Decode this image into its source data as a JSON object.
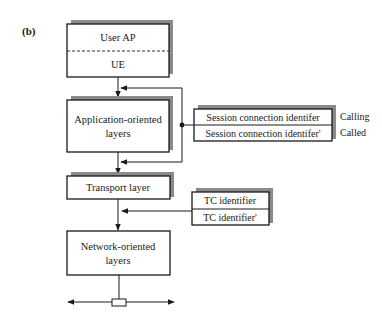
{
  "figure": {
    "label": "(b)"
  },
  "stack": {
    "user_box": {
      "top_label": "User AP",
      "bottom_label": "UE"
    },
    "application_box": {
      "line1": "Application-oriented",
      "line2": "layers"
    },
    "transport_box": {
      "label": "Transport layer"
    },
    "network_box": {
      "line1": "Network-oriented",
      "line2": "layers"
    }
  },
  "session_identifiers": {
    "rows": [
      {
        "label": "Session connection identifer",
        "side_label": "Calling"
      },
      {
        "label": "Session connection identifer'",
        "side_label": "Called"
      }
    ]
  },
  "tc_identifiers": {
    "rows": [
      {
        "label": "TC identifier"
      },
      {
        "label": "TC identifier'"
      }
    ]
  },
  "colors": {
    "line": "#1a1a1a",
    "shadow": "#8a8a8a",
    "background": "#ffffff"
  }
}
